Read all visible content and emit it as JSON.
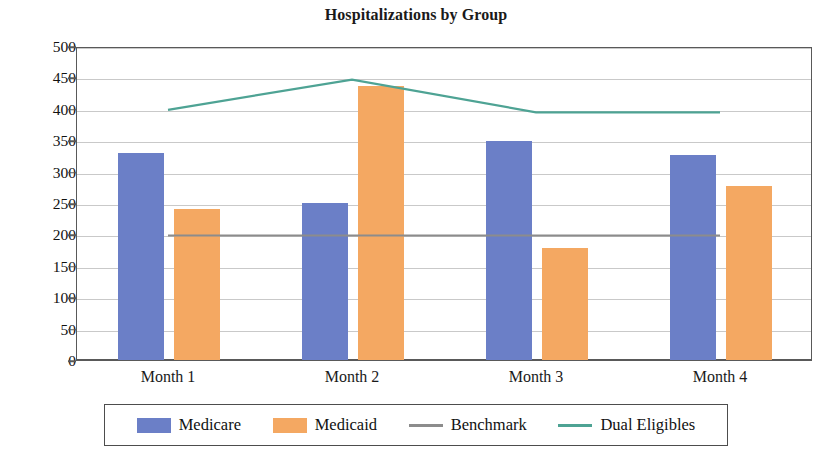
{
  "chart_data": {
    "type": "bar",
    "title": "Hospitalizations by Group",
    "xlabel": "",
    "ylabel": "",
    "categories": [
      "Month 1",
      "Month 2",
      "Month 3",
      "Month 4"
    ],
    "ylim": [
      0,
      500
    ],
    "yticks": [
      0,
      50,
      100,
      150,
      200,
      250,
      300,
      350,
      400,
      450,
      500
    ],
    "ytick_labels": [
      "0",
      "50",
      "100",
      "150",
      "200",
      "250",
      "300",
      "350",
      "400",
      "450",
      "500"
    ],
    "grid": true,
    "legend_position": "bottom",
    "series": [
      {
        "name": "Medicare",
        "type": "bar",
        "color": "#6b7fc7",
        "values": [
          330,
          250,
          348,
          327
        ]
      },
      {
        "name": "Medicaid",
        "type": "bar",
        "color": "#f4a862",
        "values": [
          240,
          437,
          178,
          277
        ]
      },
      {
        "name": "Benchmark",
        "type": "line",
        "color": "#8c8c8c",
        "values": [
          200,
          200,
          200,
          200
        ]
      },
      {
        "name": "Dual Eligibles",
        "type": "line",
        "color": "#4ea394",
        "values": [
          400,
          448,
          396,
          396
        ]
      }
    ]
  },
  "legend": {
    "items": [
      {
        "label": "Medicare",
        "marker": "bar",
        "color": "#6b7fc7"
      },
      {
        "label": "Medicaid",
        "marker": "bar",
        "color": "#f4a862"
      },
      {
        "label": "Benchmark",
        "marker": "line",
        "color": "#8c8c8c"
      },
      {
        "label": "Dual Eligibles",
        "marker": "line",
        "color": "#4ea394"
      }
    ]
  },
  "colors": {
    "medicare": "#6b7fc7",
    "medicaid": "#f4a862",
    "benchmark": "#8c8c8c",
    "dual_eligibles": "#4ea394",
    "axis": "#595959",
    "grid": "#c9c9c9",
    "background": "#ffffff"
  }
}
